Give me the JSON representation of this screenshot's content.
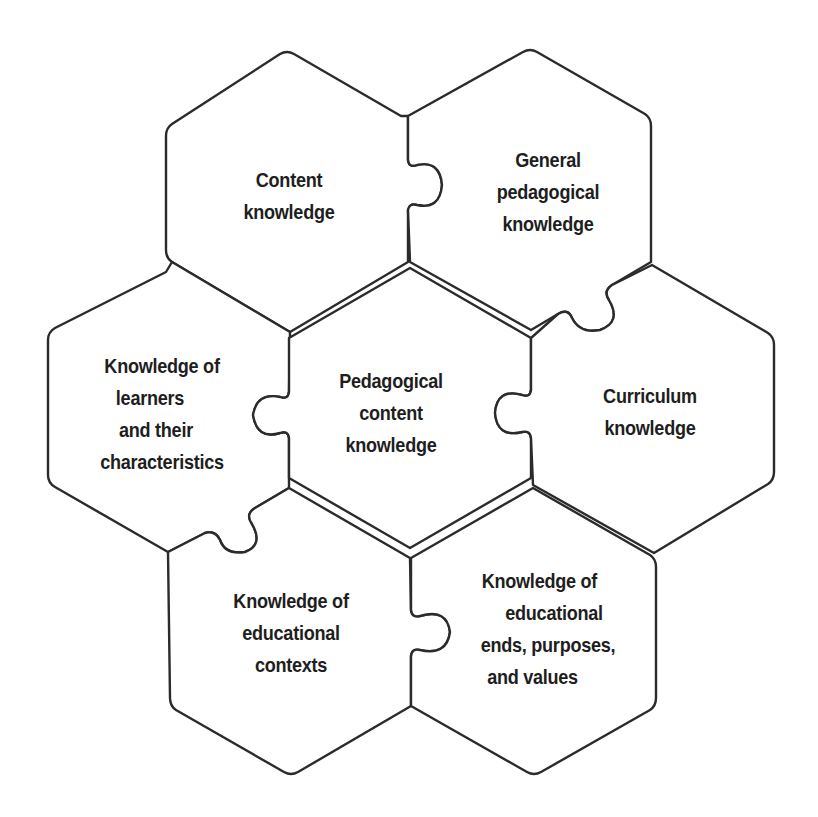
{
  "diagram": {
    "type": "hexagonal puzzle-piece diagram",
    "colors": {
      "background": "#ffffff",
      "stroke": "#2b2b2b",
      "text": "#1e1e1e"
    },
    "pieces": [
      {
        "id": "content-knowledge",
        "position": "top-left",
        "lines": [
          "Content",
          "knowledge"
        ]
      },
      {
        "id": "general-pedagogical-knowledge",
        "position": "top-right",
        "lines": [
          "General",
          "pedagogical",
          "knowledge"
        ]
      },
      {
        "id": "knowledge-of-learners",
        "position": "middle-left",
        "lines": [
          "Knowledge of",
          "learners",
          "and their",
          "characteristics"
        ]
      },
      {
        "id": "pedagogical-content-knowledge",
        "position": "center",
        "lines": [
          "Pedagogical",
          "content",
          "knowledge"
        ]
      },
      {
        "id": "curriculum-knowledge",
        "position": "middle-right",
        "lines": [
          "Curriculum",
          "knowledge"
        ]
      },
      {
        "id": "knowledge-of-educational-contexts",
        "position": "bottom-left",
        "lines": [
          "Knowledge of",
          "educational",
          "contexts"
        ]
      },
      {
        "id": "knowledge-of-educational-ends",
        "position": "bottom-right",
        "lines": [
          "Knowledge of",
          "educational",
          "ends, purposes,",
          "and values"
        ]
      }
    ]
  }
}
